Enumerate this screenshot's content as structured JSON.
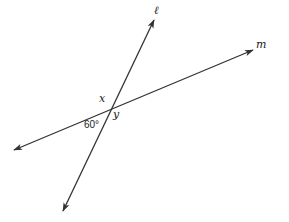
{
  "diagram": {
    "lines": [
      {
        "name": "l",
        "label": "ℓ",
        "from": [
          63,
          211
        ],
        "to": [
          154,
          20
        ]
      },
      {
        "name": "m",
        "label": "m",
        "from": [
          14,
          150
        ],
        "to": [
          253,
          50
        ]
      }
    ],
    "intersection": [
      110,
      106
    ],
    "angle_labels": {
      "x": "x",
      "y": "y",
      "given": "60°"
    },
    "colors": {
      "stroke": "#333333",
      "background": "#ffffff"
    }
  }
}
